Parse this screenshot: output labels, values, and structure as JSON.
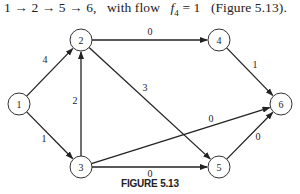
{
  "text_line": {
    "path": "1 → 2 → 5 → 6,",
    "with_flow": "with flow",
    "flow_symbol": "f",
    "flow_sub": "4",
    "flow_value": "= 1",
    "ref": "(Figure 5.13)."
  },
  "figure_label": "FIGURE 5.13",
  "graph": {
    "nodes": [
      {
        "id": "1",
        "label": "1",
        "x": 19,
        "y": 104
      },
      {
        "id": "2",
        "label": "2",
        "x": 81,
        "y": 40
      },
      {
        "id": "3",
        "label": "3",
        "x": 81,
        "y": 167
      },
      {
        "id": "4",
        "label": "4",
        "x": 219,
        "y": 40
      },
      {
        "id": "5",
        "label": "5",
        "x": 219,
        "y": 167
      },
      {
        "id": "6",
        "label": "6",
        "x": 281,
        "y": 104
      }
    ],
    "edges": [
      {
        "from": "1",
        "to": "2",
        "label": "4"
      },
      {
        "from": "1",
        "to": "3",
        "label": "1"
      },
      {
        "from": "3",
        "to": "2",
        "label": "2"
      },
      {
        "from": "2",
        "to": "4",
        "label": "0"
      },
      {
        "from": "2",
        "to": "5",
        "label": "3"
      },
      {
        "from": "4",
        "to": "6",
        "label": "1"
      },
      {
        "from": "3",
        "to": "6",
        "label": "0"
      },
      {
        "from": "3",
        "to": "5",
        "label": "0"
      },
      {
        "from": "5",
        "to": "6",
        "label": "0"
      }
    ]
  }
}
